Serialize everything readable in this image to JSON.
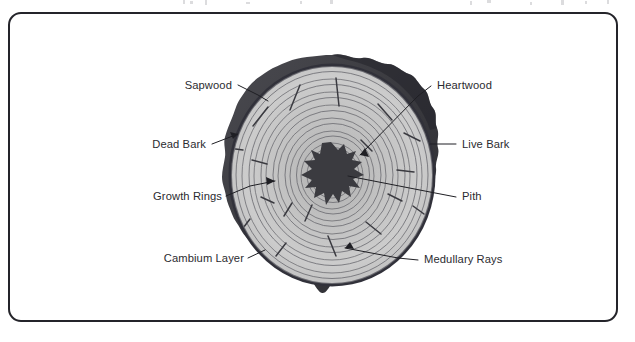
{
  "document": {
    "title": "Tree Trunk Cross Section Diagram",
    "frame": {
      "border_color": "#24242a",
      "background": "#ffffff",
      "corner_radius": 13
    }
  },
  "diagram": {
    "type": "labeled-cross-section",
    "center": {
      "x": 332,
      "y": 175
    },
    "colors": {
      "bark": "#3f3f44",
      "bark_shadow": "#2c2c31",
      "sapwood": "#c9c9c9",
      "heartwood": "#b9b9b9",
      "ring_line": "#6f6f74",
      "pith": "#3b3b40",
      "leader_line": "#1f1f24",
      "label_text": "#2b2b30"
    },
    "parts": [
      {
        "name": "dead-bark",
        "description": "outer dark lumpy bark ring"
      },
      {
        "name": "live-bark",
        "description": "inner bark layer"
      },
      {
        "name": "cambium-layer",
        "description": "thin growth layer beneath bark"
      },
      {
        "name": "sapwood",
        "description": "outer light wood zone"
      },
      {
        "name": "heartwood",
        "description": "inner darker wood zone"
      },
      {
        "name": "growth-rings",
        "description": "concentric annual rings"
      },
      {
        "name": "medullary-rays",
        "description": "short radial dashes"
      },
      {
        "name": "pith",
        "description": "irregular dark star at centre"
      }
    ],
    "ring_count": 16,
    "labels": [
      {
        "id": "sapwood",
        "text": "Sapwood",
        "side": "left",
        "text_x": 232,
        "text_y": 89,
        "leader": [
          [
            238,
            85
          ],
          [
            258,
            95
          ],
          [
            268,
            101
          ]
        ],
        "arrow": false
      },
      {
        "id": "dead-bark",
        "text": "Dead Bark",
        "side": "left",
        "text_x": 206,
        "text_y": 148,
        "leader": [
          [
            212,
            144
          ],
          [
            238,
            134
          ]
        ],
        "arrow": true
      },
      {
        "id": "growth-rings",
        "text": "Growth Rings",
        "side": "left",
        "text_x": 222,
        "text_y": 200,
        "leader": [
          [
            226,
            196
          ],
          [
            250,
            186
          ],
          [
            275,
            181
          ]
        ],
        "arrow": true
      },
      {
        "id": "cambium-layer",
        "text": "Cambium Layer",
        "side": "left",
        "text_x": 244,
        "text_y": 262,
        "leader": [
          [
            248,
            258
          ],
          [
            265,
            250
          ]
        ],
        "arrow": false
      },
      {
        "id": "heartwood",
        "text": "Heartwood",
        "side": "right",
        "text_x": 437,
        "text_y": 89,
        "leader": [
          [
            431,
            86
          ],
          [
            418,
            96
          ],
          [
            360,
            155
          ]
        ],
        "arrow": true
      },
      {
        "id": "live-bark",
        "text": "Live Bark",
        "side": "right",
        "text_x": 462,
        "text_y": 148,
        "leader": [
          [
            456,
            144
          ],
          [
            430,
            144
          ]
        ],
        "arrow": false
      },
      {
        "id": "pith",
        "text": "Pith",
        "side": "right",
        "text_x": 462,
        "text_y": 200,
        "leader": [
          [
            456,
            197
          ],
          [
            430,
            192
          ],
          [
            348,
            176
          ]
        ],
        "arrow": false
      },
      {
        "id": "medullary-rays",
        "text": "Medullary Rays",
        "side": "right",
        "text_x": 424,
        "text_y": 263,
        "leader": [
          [
            418,
            260
          ],
          [
            398,
            258
          ],
          [
            345,
            248
          ]
        ],
        "arrow": true
      }
    ]
  }
}
